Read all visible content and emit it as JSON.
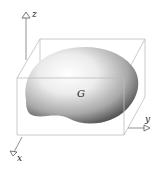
{
  "figure": {
    "region_label": "G",
    "axes": {
      "x_label": "x",
      "y_label": "y",
      "z_label": "z"
    }
  },
  "colors": {
    "box_line": "#b8b8b8",
    "axis_line": "#777777",
    "solid_light": "#ffffff",
    "solid_dark": "#3a3a3a"
  }
}
